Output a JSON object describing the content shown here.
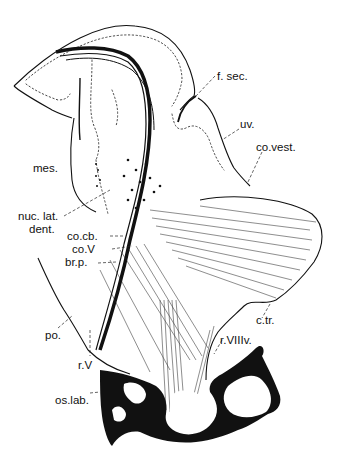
{
  "figure": {
    "type": "anatomical line drawing",
    "colors": {
      "ink": "#111111",
      "background": "#ffffff"
    },
    "labels": [
      {
        "id": "f_sec",
        "text": "f. sec.",
        "x": 217,
        "y": 70
      },
      {
        "id": "uv",
        "text": "uv.",
        "x": 240,
        "y": 123
      },
      {
        "id": "co_vest",
        "text": "co.vest.",
        "x": 256,
        "y": 146
      },
      {
        "id": "mes",
        "text": "mes.",
        "x": 33,
        "y": 162
      },
      {
        "id": "nuc_lat",
        "text": "nuc. lat.",
        "x": 18,
        "y": 216
      },
      {
        "id": "dent",
        "text": "dent.",
        "x": 29,
        "y": 229
      },
      {
        "id": "co_cb",
        "text": "co.cb.",
        "x": 67,
        "y": 233
      },
      {
        "id": "co_V",
        "text": "co.V",
        "x": 72,
        "y": 246
      },
      {
        "id": "br_p",
        "text": "br.p.",
        "x": 65,
        "y": 259
      },
      {
        "id": "c_tr",
        "text": "c.tr.",
        "x": 256,
        "y": 313
      },
      {
        "id": "po",
        "text": "po.",
        "x": 45,
        "y": 330
      },
      {
        "id": "r_VIII_v",
        "text": "r.VIIIv.",
        "x": 220,
        "y": 337
      },
      {
        "id": "r_V",
        "text": "r.V",
        "x": 78,
        "y": 358
      },
      {
        "id": "os_lab",
        "text": "os.lab.",
        "x": 55,
        "y": 393
      }
    ]
  }
}
